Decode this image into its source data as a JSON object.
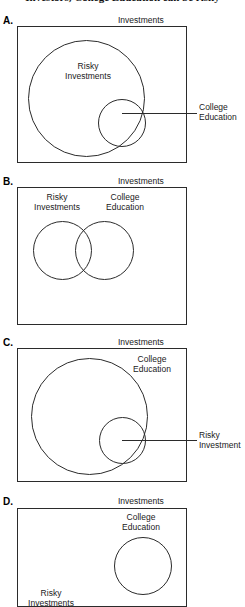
{
  "figure": {
    "caption": "Investors, College Education can be risky",
    "universe_label": "Investments"
  },
  "panels": [
    {
      "letter": "A.",
      "universe_label": "Investments",
      "outer_set_label_line1": "Risky",
      "outer_set_label_line2": "Investments",
      "callout_label_line1": "College",
      "callout_label_line2": "Education"
    },
    {
      "letter": "B.",
      "universe_label": "Investments",
      "left_set_label_line1": "Risky",
      "left_set_label_line2": "Investments",
      "right_set_label_line1": "College",
      "right_set_label_line2": "Education"
    },
    {
      "letter": "C.",
      "universe_label": "Investments",
      "outer_set_label_line1": "College",
      "outer_set_label_line2": "Education",
      "callout_label_line1": "Risky",
      "callout_label_line2": "Investment"
    },
    {
      "letter": "D.",
      "universe_label": "Investments",
      "right_set_label_line1": "College",
      "right_set_label_line2": "Education",
      "left_set_label_line1": "Risky",
      "left_set_label_line2": "Investments"
    }
  ],
  "colors": {
    "stroke": "#2b2b2b",
    "text": "#1a1a1a",
    "background": "#ffffff"
  }
}
